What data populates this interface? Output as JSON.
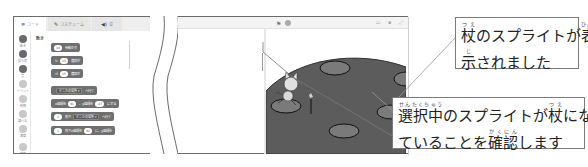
{
  "left_panel": {
    "tabs": [
      {
        "icon": "code-icon",
        "glyph": "≡",
        "label": "コード",
        "active": true
      },
      {
        "icon": "brush-icon",
        "glyph": "✎",
        "label": "コスチューム",
        "active": false
      },
      {
        "icon": "speaker-icon",
        "glyph": "◀)",
        "label": "音",
        "active": false
      }
    ],
    "categories": [
      {
        "label": "動き",
        "color": "#6a6a6a"
      },
      {
        "label": "見た目",
        "color": "#6a6a6a"
      },
      {
        "label": "音",
        "color": "#6a6a6a"
      },
      {
        "label": "イベント",
        "color": "#c9c9c9"
      },
      {
        "label": "制御",
        "color": "#c9c9c9"
      },
      {
        "label": "調べる",
        "color": "#c9c9c9"
      },
      {
        "label": "演算",
        "color": "#c9c9c9"
      },
      {
        "label": "変数",
        "color": "#c9c9c9"
      }
    ],
    "palette_title": "動き",
    "blocks": [
      {
        "parts": [
          {
            "type": "oval",
            "text": "10"
          },
          {
            "type": "text",
            "text": "歩動かす"
          }
        ]
      },
      {
        "parts": [
          {
            "type": "text",
            "text": "↻"
          },
          {
            "type": "oval",
            "text": "15"
          },
          {
            "type": "text",
            "text": "度回す"
          }
        ]
      },
      {
        "parts": [
          {
            "type": "text",
            "text": "↺"
          },
          {
            "type": "oval",
            "text": "15"
          },
          {
            "type": "text",
            "text": "度回す"
          }
        ]
      },
      {
        "parts": [
          {
            "type": "drop",
            "text": "どこかの場所 ▾"
          },
          {
            "type": "text",
            "text": "へ行く"
          }
        ]
      },
      {
        "parts": [
          {
            "type": "text",
            "text": "x座標を"
          },
          {
            "type": "oval",
            "text": "61"
          },
          {
            "type": "text",
            "text": "、y座標を"
          },
          {
            "type": "oval",
            "text": "-47"
          },
          {
            "type": "text",
            "text": "にする"
          }
        ]
      },
      {
        "parts": [
          {
            "type": "oval",
            "text": "1"
          },
          {
            "type": "text",
            "text": "秒で"
          },
          {
            "type": "drop",
            "text": "どこかの場所 ▾"
          },
          {
            "type": "text",
            "text": "へ行く"
          }
        ]
      },
      {
        "parts": [
          {
            "type": "oval",
            "text": "1"
          },
          {
            "type": "text",
            "text": "秒でx座標を"
          },
          {
            "type": "oval",
            "text": "61"
          },
          {
            "type": "text",
            "text": "に、y座標を"
          }
        ]
      }
    ]
  },
  "stage": {
    "flag_icon": "⚑",
    "view_icons": "▭ ▪ ⤢"
  },
  "callouts": [
    {
      "lines": [
        [
          {
            "kanji": "杖",
            "ruby": "つえ"
          },
          {
            "text": "のスプライトが"
          },
          {
            "kanji": "表",
            "ruby": "ひょう"
          }
        ],
        [
          {
            "kanji": "示",
            "ruby": "じ"
          },
          {
            "text": "されました"
          }
        ]
      ]
    },
    {
      "lines": [
        [
          {
            "kanji": "選択中",
            "ruby": "せんたくちゅう"
          },
          {
            "text": "のスプライトが"
          },
          {
            "kanji": "杖",
            "ruby": "つえ"
          },
          {
            "text": "になっ"
          }
        ],
        [
          {
            "text": "ていることを"
          },
          {
            "kanji": "確認",
            "ruby": "かくにん"
          },
          {
            "text": "します"
          }
        ]
      ]
    }
  ],
  "colors": {
    "block_gray": "#6f6f6f",
    "stage_ground": "#5c5c5c",
    "hole_fill": "#7a7a7a",
    "border": "#6a6a6a"
  }
}
